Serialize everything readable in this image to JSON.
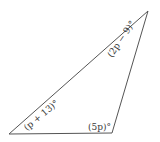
{
  "diagram": {
    "type": "triangle",
    "stroke_color": "#555555",
    "vertices": {
      "top_right": [
        148,
        11
      ],
      "bottom_left": [
        9,
        134
      ],
      "bottom_right": [
        112,
        133
      ]
    },
    "angles": {
      "bottom_left": "(p + 13)°",
      "top_right": "(2p − 9)°",
      "bottom_right": "(5p)°"
    }
  }
}
